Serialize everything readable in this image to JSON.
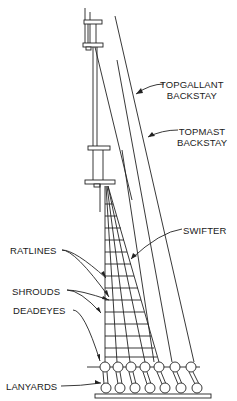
{
  "diagram": {
    "colors": {
      "line": "#222222",
      "background": "#ffffff",
      "text": "#1a1a1a"
    },
    "labels": {
      "topgallant_backstay": {
        "line1": "TOPGALLANT",
        "line2": "BACKSTAY"
      },
      "topmast_backstay": {
        "line1": "TOPMAST",
        "line2": "BACKSTAY"
      },
      "swifter": "SWIFTER",
      "ratlines": "RATLINES",
      "shrouds": "SHROUDS",
      "deadeyes": "DEADEYES",
      "lanyards": "LANYARDS"
    },
    "deadeye_count": 7
  }
}
